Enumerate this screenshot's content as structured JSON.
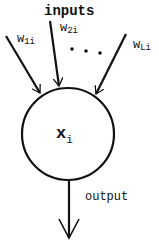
{
  "diagram": {
    "type": "neuron",
    "top_label": "inputs",
    "weights": [
      {
        "main": "w",
        "sub": "1i"
      },
      {
        "main": "w",
        "sub": "2i"
      },
      {
        "main": "w",
        "sub": "Li"
      }
    ],
    "ellipsis": "• • •",
    "node": {
      "main": "x",
      "sub": "i"
    },
    "output_label": "output",
    "colors": {
      "stroke": "#111111",
      "background": "#ffffff"
    }
  }
}
